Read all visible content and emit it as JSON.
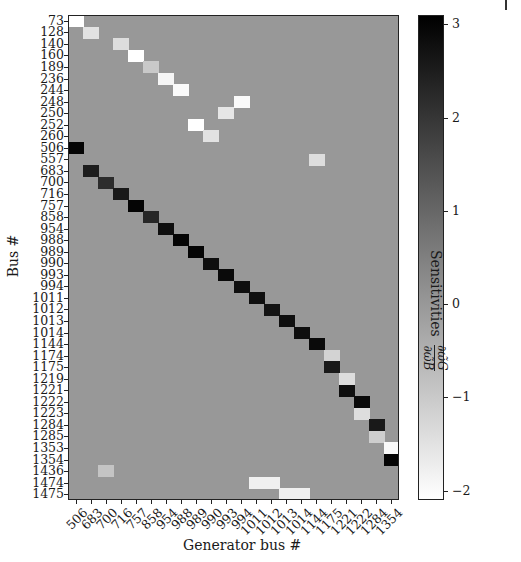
{
  "chart_data": {
    "type": "heatmap",
    "title": "",
    "xlabel": "Generator bus #",
    "ylabel": "Bus #",
    "colorbar": {
      "label": "Sensitivities",
      "label_fraction": {
        "numerator": "∂ω̃G",
        "denominator": "∂ω̃B"
      },
      "ticks": [
        3,
        2,
        1,
        0,
        -1,
        -2
      ],
      "range": [
        -2.1,
        3.1
      ],
      "colormap": "gray_r (white = low, black = high)"
    },
    "x_categories": [
      "506",
      "683",
      "700",
      "716",
      "757",
      "858",
      "954",
      "988",
      "989",
      "990",
      "993",
      "994",
      "1011",
      "1012",
      "1013",
      "1014",
      "1144",
      "1175",
      "1221",
      "1222",
      "1284",
      "1354"
    ],
    "y_categories": [
      "73",
      "128",
      "140",
      "160",
      "189",
      "236",
      "244",
      "248",
      "250",
      "252",
      "260",
      "506",
      "557",
      "683",
      "700",
      "716",
      "757",
      "858",
      "954",
      "988",
      "989",
      "990",
      "993",
      "994",
      "1011",
      "1012",
      "1013",
      "1014",
      "1144",
      "1174",
      "1175",
      "1219",
      "1221",
      "1222",
      "1223",
      "1284",
      "1285",
      "1353",
      "1354",
      "1436",
      "1474",
      "1475"
    ],
    "background_value": 0,
    "nonzero_cells": [
      {
        "row": "73",
        "col": "506",
        "value": -2.1
      },
      {
        "row": "128",
        "col": "683",
        "value": -1.5
      },
      {
        "row": "140",
        "col": "716",
        "value": -1.4
      },
      {
        "row": "160",
        "col": "757",
        "value": -2.1
      },
      {
        "row": "189",
        "col": "858",
        "value": -1.0
      },
      {
        "row": "236",
        "col": "954",
        "value": -1.9
      },
      {
        "row": "244",
        "col": "988",
        "value": -2.0
      },
      {
        "row": "248",
        "col": "994",
        "value": -2.0
      },
      {
        "row": "250",
        "col": "993",
        "value": -1.6
      },
      {
        "row": "252",
        "col": "989",
        "value": -2.1
      },
      {
        "row": "260",
        "col": "990",
        "value": -1.5
      },
      {
        "row": "506",
        "col": "506",
        "value": 3.0
      },
      {
        "row": "557",
        "col": "1144",
        "value": -1.4
      },
      {
        "row": "683",
        "col": "683",
        "value": 2.5
      },
      {
        "row": "700",
        "col": "700",
        "value": 2.2
      },
      {
        "row": "716",
        "col": "716",
        "value": 2.6
      },
      {
        "row": "757",
        "col": "757",
        "value": 3.0
      },
      {
        "row": "858",
        "col": "858",
        "value": 2.3
      },
      {
        "row": "954",
        "col": "954",
        "value": 2.8
      },
      {
        "row": "988",
        "col": "988",
        "value": 3.0
      },
      {
        "row": "989",
        "col": "989",
        "value": 3.0
      },
      {
        "row": "990",
        "col": "990",
        "value": 2.8
      },
      {
        "row": "993",
        "col": "993",
        "value": 2.9
      },
      {
        "row": "994",
        "col": "994",
        "value": 2.8
      },
      {
        "row": "1011",
        "col": "1011",
        "value": 2.8
      },
      {
        "row": "1012",
        "col": "1012",
        "value": 2.7
      },
      {
        "row": "1013",
        "col": "1013",
        "value": 2.8
      },
      {
        "row": "1014",
        "col": "1014",
        "value": 2.8
      },
      {
        "row": "1144",
        "col": "1144",
        "value": 2.9
      },
      {
        "row": "1174",
        "col": "1175",
        "value": -1.2
      },
      {
        "row": "1175",
        "col": "1175",
        "value": 2.6
      },
      {
        "row": "1219",
        "col": "1221",
        "value": -1.4
      },
      {
        "row": "1221",
        "col": "1221",
        "value": 2.8
      },
      {
        "row": "1222",
        "col": "1222",
        "value": 2.9
      },
      {
        "row": "1223",
        "col": "1222",
        "value": -1.4
      },
      {
        "row": "1284",
        "col": "1284",
        "value": 2.6
      },
      {
        "row": "1285",
        "col": "1284",
        "value": -1.1
      },
      {
        "row": "1353",
        "col": "1354",
        "value": -2.0
      },
      {
        "row": "1354",
        "col": "1354",
        "value": 3.0
      },
      {
        "row": "1436",
        "col": "700",
        "value": -0.9
      },
      {
        "row": "1474",
        "col": "1011",
        "value": -1.8
      },
      {
        "row": "1474",
        "col": "1012",
        "value": -1.8
      },
      {
        "row": "1475",
        "col": "1013",
        "value": -1.8
      },
      {
        "row": "1475",
        "col": "1014",
        "value": -1.8
      }
    ],
    "grid": false,
    "legend_position": "colorbar-right"
  }
}
